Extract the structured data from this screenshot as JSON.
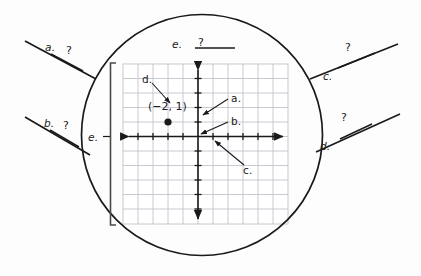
{
  "figure": {
    "type": "magnified-coordinate-plane-labeling-exercise",
    "background_color": "#fdfdfd",
    "ink_color": "#1a1a1a",
    "grid_color": "#b9b9c2"
  },
  "magnifier": {
    "name": "circle-magnifier",
    "center_x": 202,
    "center_y": 135,
    "radius": 121,
    "stroke_color": "#1a1a1a"
  },
  "coordinate_plane": {
    "title": "",
    "grid_columns": 11,
    "grid_rows": 11,
    "x_axis_label": "",
    "y_axis_label": "",
    "plotted_point": {
      "label": "(−2, 1)",
      "x": -2,
      "y": 1,
      "marker": "filled-circle"
    }
  },
  "callouts": [
    {
      "id": "a",
      "label": "a.",
      "blank_text": "?",
      "points_to": "y-axis tick mark (unit on vertical axis)",
      "side": "left-outer"
    },
    {
      "id": "b",
      "label": "b.",
      "blank_text": "?",
      "points_to": "origin",
      "side": "left-outer"
    },
    {
      "id": "c",
      "label": "c.",
      "blank_text": "?",
      "points_to": "x-axis tick mark (unit on horizontal axis)",
      "side": "right-outer"
    },
    {
      "id": "d",
      "label": "d.",
      "blank_text": "?",
      "points_to": "ordered pair label (−2, 1)",
      "side": "right-outer"
    },
    {
      "id": "e",
      "label": "e.",
      "blank_text": "?",
      "points_to": "the whole grid / coordinate plane",
      "side": "top"
    }
  ],
  "inner_labels": {
    "a": "a.",
    "b": "b.",
    "c": "c.",
    "d": "d.",
    "e_left": "e."
  },
  "outer_labels": {
    "a": "a.",
    "b": "b.",
    "c": "c.",
    "d": "d.",
    "e_top": "e."
  },
  "blanks": {
    "a": "?",
    "b": "?",
    "c": "?",
    "d": "?",
    "e_top": "?"
  }
}
